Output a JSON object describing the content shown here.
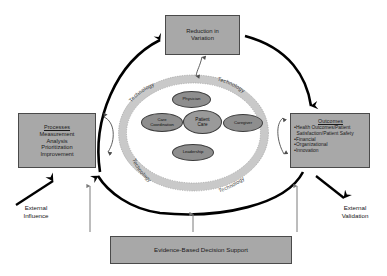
{
  "diagram": {
    "colors": {
      "box_fill": "#a8a8a8",
      "box_border": "#4a4a4a",
      "oval_fill": "#8e8e8e",
      "ring_fill": "#c9c9c9",
      "arrow_major": "#000000",
      "arrow_minor": "#6f6f6f",
      "text": "#1a1a1a"
    },
    "boxes": {
      "reduction": {
        "line1": "Reduction in",
        "line2": "Variation"
      },
      "processes": {
        "header": "Processes",
        "items": [
          "Measurement",
          "Analysis",
          "Prioritization",
          "Improvement"
        ]
      },
      "outcomes": {
        "header": "Outcomes",
        "bullet_char": "•",
        "items": [
          "Health Outcomes/Patient",
          "Satisfaction/Patient Safety",
          "Financial",
          "Organizational",
          "Innovation"
        ],
        "item1": "Health Outcomes/Patient",
        "item1_cont": "Satisfaction/Patient Safety",
        "item2": "Financial",
        "item3": "Organizational",
        "item4": "Innovation"
      },
      "evidence": {
        "label": "Evidence-Based Decision Support"
      }
    },
    "external": {
      "influence": "External\nInfluence",
      "validation": "External\nValidation"
    },
    "core": {
      "ovals": [
        {
          "id": "physician",
          "label": "Physician"
        },
        {
          "id": "care",
          "label": "Care\nCoordination"
        },
        {
          "id": "patient",
          "label": "Patient\nCare"
        },
        {
          "id": "caregiver",
          "label": "Caregiver"
        },
        {
          "id": "leadership",
          "label": "Leadership"
        }
      ],
      "ring_labels": [
        {
          "id": "top-left",
          "label": "Technology"
        },
        {
          "id": "top-right",
          "label": "Technology"
        },
        {
          "id": "bottom-left",
          "label": "Technology"
        },
        {
          "id": "bottom-right",
          "label": "Technology"
        }
      ]
    }
  }
}
